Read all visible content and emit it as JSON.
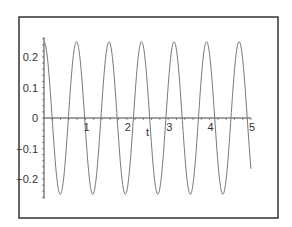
{
  "chart_data": {
    "type": "line",
    "title": "",
    "xlabel": "t",
    "ylabel": "",
    "xlim": [
      0,
      5
    ],
    "ylim": [
      -0.25,
      0.25
    ],
    "x_ticks": [
      1,
      2,
      3,
      4,
      5
    ],
    "x_tick_labels": [
      "1",
      "2",
      "3",
      "4",
      "5"
    ],
    "y_ticks": [
      0.2,
      0.1,
      0,
      -0.1,
      -0.2
    ],
    "y_tick_labels": [
      "0.2",
      "0.1",
      "0",
      "−0.1",
      "−0.2"
    ],
    "grid": false,
    "legend": null,
    "series": [
      {
        "name": "y(t)",
        "function": "0.25*cos(8*t)",
        "amplitude": 0.25,
        "angular_frequency": 8,
        "t_range": [
          0,
          5
        ],
        "color": "#777777",
        "sample_points": [
          {
            "t": 0.0,
            "y": 0.25
          },
          {
            "t": 0.196,
            "y": 0.0
          },
          {
            "t": 0.393,
            "y": -0.25
          },
          {
            "t": 0.589,
            "y": 0.0
          },
          {
            "t": 0.785,
            "y": 0.25
          },
          {
            "t": 1.178,
            "y": -0.25
          },
          {
            "t": 1.571,
            "y": 0.25
          },
          {
            "t": 1.963,
            "y": -0.25
          },
          {
            "t": 2.356,
            "y": 0.25
          },
          {
            "t": 2.749,
            "y": -0.25
          },
          {
            "t": 3.142,
            "y": 0.25
          },
          {
            "t": 3.534,
            "y": -0.25
          },
          {
            "t": 3.927,
            "y": 0.25
          },
          {
            "t": 4.32,
            "y": -0.25
          },
          {
            "t": 4.712,
            "y": 0.25
          },
          {
            "t": 5.0,
            "y": -0.167
          }
        ]
      }
    ]
  },
  "colors": {
    "frame": "#333333",
    "axis": "#444444",
    "curve": "#777777",
    "background": "#ffffff"
  }
}
